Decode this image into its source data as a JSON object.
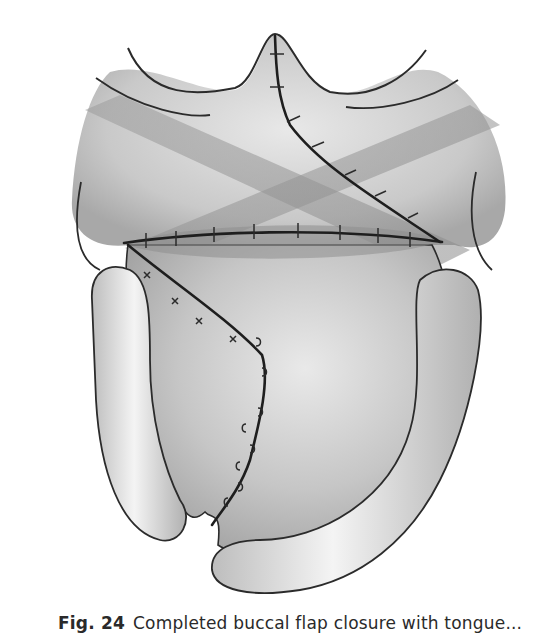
{
  "figure": {
    "colors": {
      "background": "#ffffff",
      "tissue_light": "#e2e2e2",
      "tissue_mid": "#c4c4c4",
      "tissue_dark": "#9a9a9a",
      "outline": "#2b2b2b",
      "suture": "#1e1e1e"
    }
  },
  "caption": {
    "label": "Fig. 24",
    "text": "Completed buccal flap closure with tongue..."
  }
}
